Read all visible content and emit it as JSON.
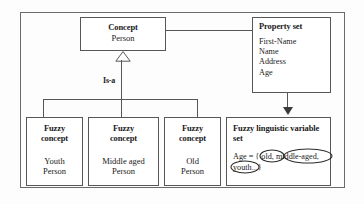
{
  "diagram": {
    "colors": {
      "background": "#fdfdfd",
      "box_border": "#575757",
      "frame_border": "#6a6a6a",
      "text": "#1b1b1b",
      "arrow_fill": "#3a3a3a",
      "annotation_ink": "#2a2a2a"
    },
    "concept": {
      "title": "Concept",
      "body": "Person"
    },
    "property_set": {
      "title": "Property set",
      "properties": [
        "First-Name",
        "Name",
        "Address",
        "Age"
      ]
    },
    "relation": {
      "generalization_label": "Is-a",
      "generalization_arrow": "hollow-triangle-icon",
      "property_link_arrow": "solid-arrowhead-icon",
      "concept_property_link": "plain-association-line"
    },
    "fuzzy_concepts": [
      {
        "title_line1": "Fuzzy",
        "title_line2": "concept",
        "body_line1": "Youth",
        "body_line2": "Person"
      },
      {
        "title_line1": "Fuzzy",
        "title_line2": "concept",
        "body_line1": "Middle aged",
        "body_line2": "Person"
      },
      {
        "title_line1": "Fuzzy",
        "title_line2": "concept",
        "body_line1": "Old",
        "body_line2": "Person"
      }
    ],
    "fuzzy_linguistic_variable_set": {
      "title_line1": "Fuzzy linguistic variable",
      "title_line2": "set",
      "expression": "Age = { old, middle-aged, youth...}",
      "expression_prefix": "Age = {",
      "terms": [
        "old,",
        "middle-aged,",
        "youth"
      ],
      "expression_suffix": "...}",
      "annotations": [
        {
          "shape": "hand-drawn-ellipse",
          "target": "old,"
        },
        {
          "shape": "hand-drawn-ellipse",
          "target": "middle-aged,"
        },
        {
          "shape": "hand-drawn-ellipse",
          "target": "youth"
        }
      ]
    }
  }
}
